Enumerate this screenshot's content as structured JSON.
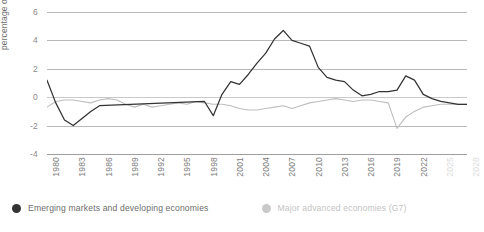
{
  "chart_data": {
    "type": "line",
    "title": "",
    "xlabel": "",
    "ylabel": "percentage of GDP",
    "ylim": [
      -4,
      6
    ],
    "yticks": [
      6,
      4,
      2,
      0,
      -2,
      -4
    ],
    "xlim": [
      1980,
      2028
    ],
    "xticks": [
      1980,
      1983,
      1986,
      1989,
      1992,
      1995,
      1998,
      2001,
      2004,
      2007,
      2010,
      2013,
      2016,
      2019,
      2022,
      2025,
      2028
    ],
    "xticks_projected": [
      2025,
      2028
    ],
    "grid": true,
    "legend_position": "bottom-left",
    "series": [
      {
        "name": "Emerging markets and developing economies",
        "color": "#333333",
        "x": [
          1980,
          1981,
          1982,
          1983,
          1984,
          1985,
          1986,
          1998,
          1999,
          2000,
          2001,
          2002,
          2003,
          2004,
          2005,
          2006,
          2007,
          2008,
          2009,
          2010,
          2011,
          2012,
          2013,
          2014,
          2015,
          2016,
          2017,
          2018,
          2019,
          2020,
          2021,
          2022,
          2023,
          2024,
          2025,
          2026,
          2027,
          2028
        ],
        "values": [
          1.2,
          -0.4,
          -1.6,
          -2.0,
          -1.5,
          -1.0,
          -0.6,
          -0.3,
          -1.3,
          0.2,
          1.1,
          0.9,
          1.6,
          2.4,
          3.1,
          4.1,
          4.7,
          4.0,
          3.8,
          3.6,
          2.1,
          1.4,
          1.2,
          1.1,
          0.5,
          0.1,
          0.2,
          0.4,
          0.4,
          0.5,
          1.5,
          1.2,
          0.2,
          -0.1,
          -0.3,
          -0.4,
          -0.5,
          -0.5
        ]
      },
      {
        "name": "Major advanced economies (G7)",
        "color": "#bdbdbd",
        "x": [
          1980,
          1981,
          1982,
          1983,
          1984,
          1985,
          1986,
          1987,
          1988,
          1989,
          1990,
          1991,
          1992,
          1993,
          1994,
          1995,
          1996,
          1997,
          1998,
          1999,
          2000,
          2001,
          2002,
          2003,
          2004,
          2005,
          2006,
          2007,
          2008,
          2009,
          2010,
          2011,
          2012,
          2013,
          2014,
          2015,
          2016,
          2017,
          2018,
          2019,
          2020,
          2021,
          2022,
          2023,
          2024,
          2025,
          2026,
          2027,
          2028
        ],
        "values": [
          -0.7,
          -0.3,
          -0.2,
          -0.2,
          -0.3,
          -0.4,
          -0.2,
          -0.1,
          -0.2,
          -0.5,
          -0.7,
          -0.5,
          -0.7,
          -0.6,
          -0.5,
          -0.4,
          -0.5,
          -0.3,
          -0.4,
          -0.5,
          -0.5,
          -0.6,
          -0.8,
          -0.9,
          -0.9,
          -0.8,
          -0.7,
          -0.6,
          -0.8,
          -0.6,
          -0.4,
          -0.3,
          -0.2,
          -0.1,
          -0.2,
          -0.3,
          -0.2,
          -0.2,
          -0.3,
          -0.4,
          -2.2,
          -1.4,
          -1.0,
          -0.7,
          -0.6,
          -0.5,
          -0.5,
          -0.5,
          -0.5
        ]
      }
    ]
  },
  "axis": {
    "y_title": "percentage of GDP"
  },
  "legend": {
    "emerging": {
      "label": "Emerging markets and developing economies",
      "color": "#333333"
    },
    "advanced": {
      "label": "Major advanced economies (G7)",
      "color": "#c9c9c9"
    }
  }
}
